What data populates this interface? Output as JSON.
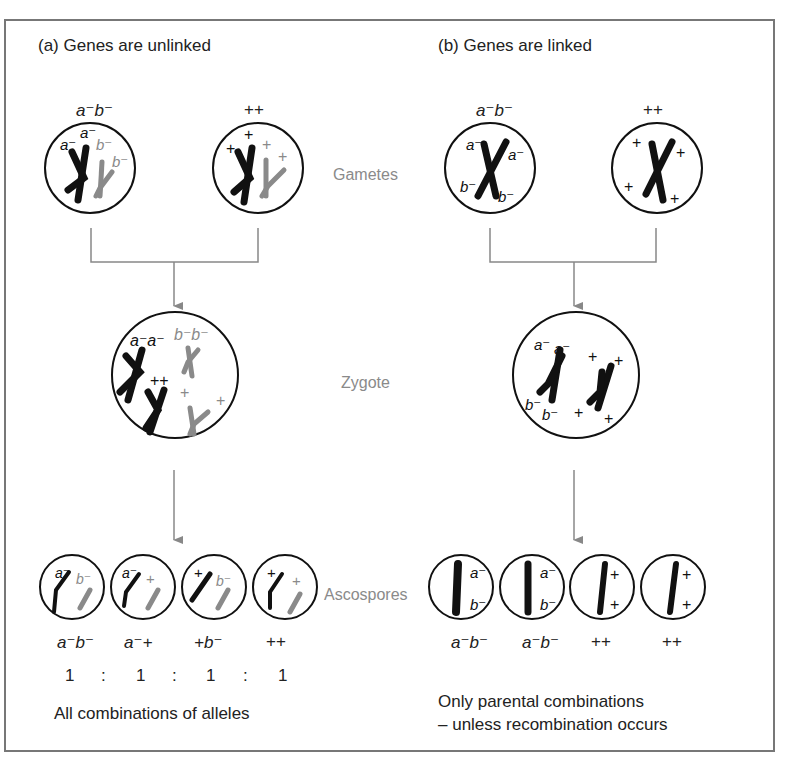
{
  "figure": {
    "panel_a": {
      "title": "(a) Genes are unlinked",
      "gametes": [
        {
          "label": "a⁻b⁻",
          "chromosome_labels": [
            "a⁻",
            "a⁻",
            "b⁻",
            "b⁻"
          ]
        },
        {
          "label": "++",
          "chromosome_labels": [
            "+",
            "+",
            "+",
            "+"
          ]
        }
      ],
      "zygote_labels": [
        "a⁻a⁻",
        "b⁻b⁻",
        "++",
        "+",
        "+"
      ],
      "ascospores": [
        {
          "genotype": "a⁻b⁻",
          "ratio": "1"
        },
        {
          "genotype": "a⁻+",
          "ratio": "1"
        },
        {
          "genotype": "+b⁻",
          "ratio": "1"
        },
        {
          "genotype": "++",
          "ratio": "1"
        }
      ],
      "ratio_separator": ":",
      "caption": "All combinations of alleles"
    },
    "panel_b": {
      "title": "(b) Genes are linked",
      "gametes": [
        {
          "label": "a⁻b⁻",
          "chromosome_labels": [
            "a⁻",
            "a⁻",
            "b⁻",
            "b⁻"
          ]
        },
        {
          "label": "++",
          "chromosome_labels": [
            "+",
            "+",
            "+",
            "+"
          ]
        }
      ],
      "zygote_labels": [
        "a⁻",
        "a⁻",
        "b⁻",
        "b⁻",
        "+",
        "+",
        "+",
        "+"
      ],
      "ascospores": [
        {
          "genotype": "a⁻b⁻"
        },
        {
          "genotype": "a⁻b⁻"
        },
        {
          "genotype": "++"
        },
        {
          "genotype": "++"
        }
      ],
      "caption_line1": "Only parental combinations",
      "caption_line2": "– unless recombination occurs"
    },
    "stages": {
      "gametes": "Gametes",
      "zygote": "Zygote",
      "ascospores": "Ascospores"
    },
    "colors": {
      "black_chromosome": "#111111",
      "grey_chromosome": "#8a8a8a",
      "lines": "#888888",
      "frame": "#777777"
    }
  }
}
